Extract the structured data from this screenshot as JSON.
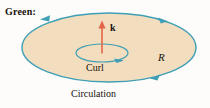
{
  "figure": {
    "title_label": "Green:",
    "region_label": "R",
    "vector_label": "k",
    "curl_label": "Curl",
    "circulation_label": "Circulation",
    "colors": {
      "region_fill": "#f2ddbf",
      "boundary_stroke": "#3f9fb5",
      "vector_arrow": "#e2654a",
      "text": "#17120e",
      "background": "#fdfcfa"
    },
    "shapes": {
      "region_ellipse": {
        "name": "region-R-ellipse",
        "cx": 109,
        "cy": 47.5,
        "rx": 87,
        "ry": 34.5,
        "orientation": "counterclockwise"
      },
      "curl_ellipse": {
        "name": "curl-loop-ellipse",
        "cx": 102,
        "cy": 53,
        "rx": 26,
        "ry": 9,
        "orientation": "counterclockwise"
      },
      "normal_vector": {
        "name": "k-normal-vector",
        "x": 102,
        "y_tail": 53,
        "y_head": 22
      }
    },
    "arrowheads": [
      {
        "name": "boundary-arrowhead-top-left",
        "x": 47,
        "y": 19,
        "direction": "left"
      },
      {
        "name": "boundary-arrowhead-top-right",
        "x": 165,
        "y": 20,
        "direction": "left"
      },
      {
        "name": "boundary-arrowhead-bottom-right",
        "x": 152,
        "y": 77,
        "direction": "right"
      },
      {
        "name": "curl-arrowhead",
        "x": 120,
        "y": 60,
        "direction": "right"
      }
    ]
  }
}
